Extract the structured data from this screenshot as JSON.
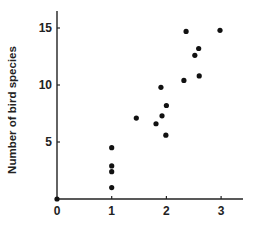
{
  "chart_data": {
    "type": "scatter",
    "title": "",
    "xlabel": "",
    "ylabel": "Number of bird species",
    "xlim": [
      0,
      3.4
    ],
    "ylim": [
      0,
      16.5
    ],
    "xticks": [
      0,
      1,
      2,
      3
    ],
    "yticks": [
      5,
      10,
      15
    ],
    "xtick_labels": [
      "0",
      "1",
      "2",
      "3"
    ],
    "ytick_labels": [
      "5",
      "10",
      "15"
    ],
    "grid": false,
    "legend": null,
    "series": [
      {
        "name": "bird species",
        "color": "#111111",
        "points": [
          {
            "x": 0.0,
            "y": 0.0
          },
          {
            "x": 1.0,
            "y": 1.0
          },
          {
            "x": 1.0,
            "y": 2.4
          },
          {
            "x": 1.0,
            "y": 2.9
          },
          {
            "x": 1.0,
            "y": 4.5
          },
          {
            "x": 1.45,
            "y": 7.1
          },
          {
            "x": 1.81,
            "y": 6.6
          },
          {
            "x": 1.9,
            "y": 9.8
          },
          {
            "x": 1.92,
            "y": 7.3
          },
          {
            "x": 1.99,
            "y": 5.6
          },
          {
            "x": 2.0,
            "y": 8.2
          },
          {
            "x": 2.32,
            "y": 10.4
          },
          {
            "x": 2.36,
            "y": 14.7
          },
          {
            "x": 2.52,
            "y": 12.6
          },
          {
            "x": 2.59,
            "y": 13.2
          },
          {
            "x": 2.6,
            "y": 10.8
          },
          {
            "x": 2.98,
            "y": 14.8
          }
        ]
      }
    ]
  }
}
